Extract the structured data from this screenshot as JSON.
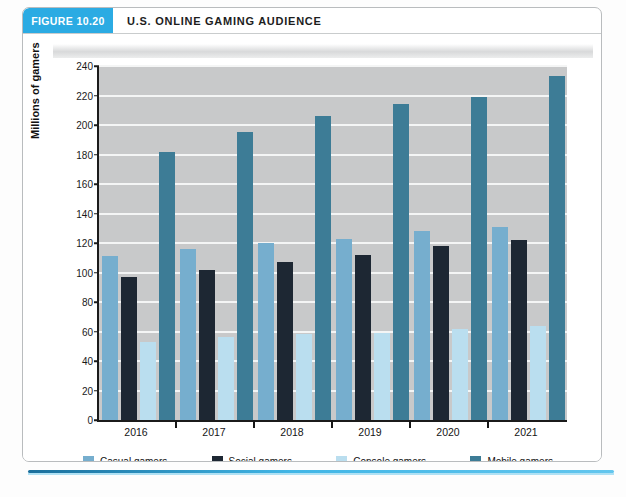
{
  "header": {
    "figure_label": "FIGURE 10.20",
    "title": "U.S. ONLINE GAMING AUDIENCE"
  },
  "colors": {
    "badge": "#2babe3",
    "casual": "#76aece",
    "social": "#1d2733",
    "console": "#badeef",
    "mobile": "#3d7c96",
    "plot_background": "#c8c9ca",
    "gridline": "#f4f5f5",
    "rule": "#41b6e6"
  },
  "chart_data": {
    "type": "bar",
    "title": "U.S. ONLINE GAMING AUDIENCE",
    "xlabel": "",
    "ylabel": "Millions of gamers",
    "categories": [
      "2016",
      "2017",
      "2018",
      "2019",
      "2020",
      "2021"
    ],
    "ylim": [
      0,
      240
    ],
    "yticks": [
      0,
      20,
      40,
      60,
      80,
      100,
      120,
      140,
      160,
      180,
      200,
      220,
      240
    ],
    "ytick_labels": [
      "0",
      "20",
      "40",
      "60",
      "80",
      "100",
      "120",
      "140",
      "160",
      "180",
      "200",
      "220",
      "240"
    ],
    "grid": true,
    "legend_position": "bottom",
    "series": [
      {
        "name": "Casual gamers",
        "color": "#76aece",
        "values": [
          111,
          116,
          120,
          123,
          128,
          131
        ]
      },
      {
        "name": "Social gamers",
        "color": "#1d2733",
        "values": [
          97,
          102,
          107,
          112,
          118,
          122
        ]
      },
      {
        "name": "Console gamers",
        "color": "#badeef",
        "values": [
          53,
          56,
          58,
          59,
          62,
          64
        ]
      },
      {
        "name": "Mobile gamers",
        "color": "#3d7c96",
        "values": [
          182,
          195,
          206,
          214,
          219,
          233
        ]
      }
    ]
  }
}
